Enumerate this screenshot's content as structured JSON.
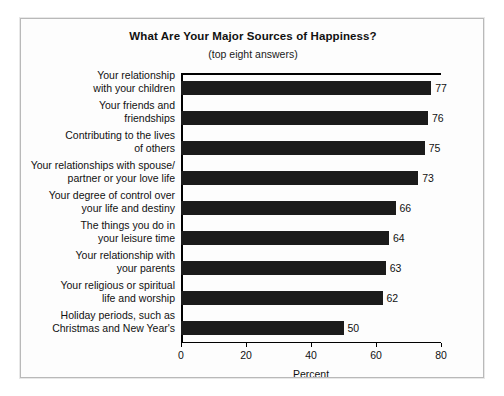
{
  "chart_data": {
    "type": "bar",
    "orientation": "horizontal",
    "title": "What Are Your Major Sources of Happiness?",
    "subtitle": "(top eight answers)",
    "xlabel": "Percent",
    "ylabel": "",
    "xlim": [
      0,
      80
    ],
    "xticks": [
      0,
      20,
      40,
      60,
      80
    ],
    "xtick_labels": [
      "0",
      "20",
      "40",
      "60",
      "80"
    ],
    "grid": false,
    "legend": false,
    "bar_color": "#1b1b1b",
    "categories": [
      "Your relationship\nwith your children",
      "Your friends and\nfriendships",
      "Contributing to the lives\nof others",
      "Your relationships with spouse/\npartner or your love life",
      "Your degree of control over\nyour life and destiny",
      "The things you do in\nyour leisure time",
      "Your relationship with\nyour parents",
      "Your religious or spiritual\nlife and worship",
      "Holiday periods, such as\nChristmas and New Year's"
    ],
    "values": [
      77,
      76,
      75,
      73,
      66,
      64,
      63,
      62,
      50
    ],
    "value_labels": [
      "77",
      "76",
      "75",
      "73",
      "66",
      "64",
      "63",
      "62",
      "50"
    ]
  }
}
